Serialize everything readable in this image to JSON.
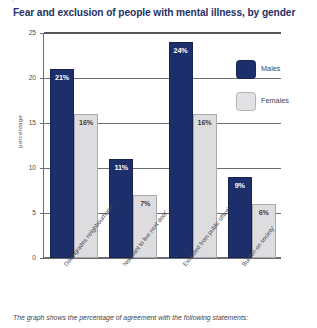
{
  "chart_data": {
    "type": "bar",
    "title": "Fear and exclusion of people with mental illness, by gender",
    "xlabel": "",
    "ylabel": "percentage",
    "ylim": [
      0,
      25
    ],
    "yticks": [
      0,
      5,
      10,
      15,
      20,
      25
    ],
    "grid": true,
    "legend_position": "right",
    "categories": [
      "Downgrades neighbourhood'",
      "Not want to live next door'",
      "Excluded from public office'",
      "Burden on society'"
    ],
    "series": [
      {
        "name": "Males",
        "color": "#1d2f6b",
        "values": [
          21,
          11,
          24,
          9
        ],
        "labels": [
          "21%",
          "11%",
          "24%",
          "9%"
        ]
      },
      {
        "name": "Females",
        "color": "#dddde0",
        "values": [
          16,
          7,
          16,
          6
        ],
        "labels": [
          "16%",
          "7%",
          "16%",
          "6%"
        ]
      }
    ]
  },
  "footnote": "The graph shows the percentage of agreement with the following statements:"
}
